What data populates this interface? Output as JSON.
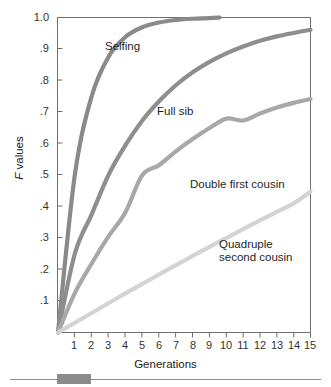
{
  "chart_data": {
    "type": "line",
    "title": "",
    "xlabel": "Generations",
    "ylabel": "F values",
    "ylabel_italic_prefix": "F",
    "ylabel_rest": " values",
    "xlim": [
      0,
      15
    ],
    "ylim": [
      0,
      1.0
    ],
    "grid": false,
    "legend_position": "inline-annotations",
    "xticks": [
      "1",
      "2",
      "3",
      "4",
      "5",
      "6",
      "7",
      "8",
      "9",
      "10",
      "11",
      "12",
      "13",
      "14",
      "15"
    ],
    "xtick_values": [
      1,
      2,
      3,
      4,
      5,
      6,
      7,
      8,
      9,
      10,
      11,
      12,
      13,
      14,
      15
    ],
    "yticks": [
      "1.0",
      ".9",
      ".8",
      ".7",
      ".6",
      ".5",
      ".4",
      ".3",
      ".2",
      ".1"
    ],
    "ytick_values": [
      1.0,
      0.9,
      0.8,
      0.7,
      0.6,
      0.5,
      0.4,
      0.3,
      0.2,
      0.1
    ],
    "x": [
      0,
      1,
      2,
      3,
      4,
      5,
      6,
      7,
      8,
      9,
      10,
      11,
      12,
      13,
      14,
      15
    ],
    "series": [
      {
        "name": "Selfing",
        "color": "#8a8a8a",
        "label_x": 105,
        "label_y": 40,
        "x_end": 9.6,
        "values": [
          0.0,
          0.5,
          0.75,
          0.875,
          0.938,
          0.969,
          0.984,
          0.992,
          0.996,
          0.998,
          1.0,
          1.0,
          1.0,
          1.0,
          1.0,
          1.0
        ]
      },
      {
        "name": "Full sib",
        "color": "#8e8e8e",
        "label_x": 157,
        "label_y": 105,
        "x_end": 15,
        "values": [
          0.0,
          0.25,
          0.375,
          0.5,
          0.594,
          0.672,
          0.734,
          0.785,
          0.826,
          0.859,
          0.886,
          0.908,
          0.926,
          0.94,
          0.951,
          0.961
        ]
      },
      {
        "name": "Double first cousin",
        "color": "#a8a8a8",
        "label_x": 190,
        "label_y": 178,
        "x_end": 15,
        "values": [
          0.0,
          0.125,
          0.219,
          0.305,
          0.381,
          0.499,
          0.531,
          0.575,
          0.614,
          0.649,
          0.679,
          0.673,
          0.695,
          0.714,
          0.729,
          0.741
        ]
      },
      {
        "name": "Quadruple second cousin",
        "color": "#d3d3d3",
        "label_x": 219,
        "label_y": 238,
        "x_end": 15,
        "values": [
          0.0,
          0.031,
          0.062,
          0.093,
          0.124,
          0.154,
          0.184,
          0.214,
          0.243,
          0.272,
          0.3,
          0.328,
          0.356,
          0.383,
          0.41,
          0.447
        ]
      }
    ],
    "annotations": [
      {
        "text": "Selfing",
        "x": 105,
        "y": 40
      },
      {
        "text": "Full sib",
        "x": 157,
        "y": 105
      },
      {
        "text": "Double first cousin",
        "x": 190,
        "y": 178
      },
      {
        "text": "Quadruple",
        "x": 219,
        "y": 238
      },
      {
        "text": "second cousin",
        "x": 219,
        "y": 251
      }
    ]
  },
  "axes": {
    "y_title_italic": "F",
    "y_title_rest": " values",
    "x_title": "Generations"
  },
  "curve_labels": {
    "selfing": "Selfing",
    "full_sib": "Full sib",
    "double_first_cousin": "Double first cousin",
    "quadruple_second_cousin_line1": "Quadruple",
    "quadruple_second_cousin_line2": "second cousin"
  },
  "colors": {
    "axis": "#6f6f6f",
    "text": "#222222",
    "selfing": "#8a8a8a",
    "full_sib": "#8e8e8e",
    "double_first_cousin": "#a8a8a8",
    "quadruple_second_cousin": "#d3d3d3",
    "footer_block": "#8b8b8b",
    "footer_rule": "#8d8d8d"
  }
}
